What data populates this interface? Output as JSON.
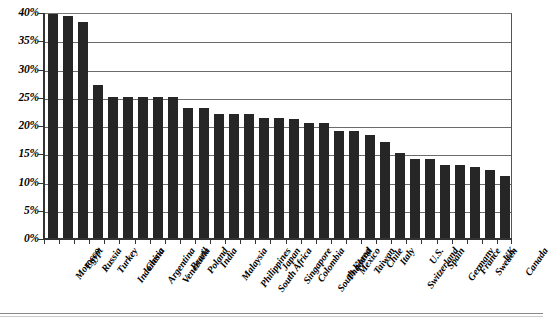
{
  "chart_data": {
    "type": "bar",
    "title": "",
    "xlabel": "",
    "ylabel": "",
    "ylim": [
      0,
      40
    ],
    "ytick_values": [
      0,
      5,
      10,
      15,
      20,
      25,
      30,
      35,
      40
    ],
    "ytick_labels": [
      "0%",
      "5%",
      "10%",
      "15%",
      "20%",
      "25%",
      "30%",
      "35%",
      "40%"
    ],
    "grid": true,
    "legend": "none",
    "bar_color": "#262626",
    "categories": [
      "Morocco",
      "Egypt",
      "Russia",
      "Turkey",
      "Indonesia",
      "China",
      "Argentina",
      "Venezuela",
      "Brazil",
      "Poland",
      "India",
      "Malaysia",
      "Philippines",
      "South Africa",
      "Japan",
      "Singapore",
      "Colombia",
      "South Korea",
      "Thailand",
      "Mexico",
      "Taiwan",
      "Chile",
      "Italy",
      "Switzerland",
      "U.S.",
      "Spain",
      "Germany",
      "France",
      "Sweden",
      "UK",
      "Canada"
    ],
    "values": [
      41,
      39.3,
      38.3,
      27,
      25,
      25,
      25,
      25,
      25,
      23,
      23,
      22,
      22,
      22,
      21.3,
      21.3,
      21,
      20.3,
      20.3,
      19,
      19,
      18.3,
      17,
      15,
      14,
      14,
      13,
      13,
      12.6,
      12,
      11
    ]
  }
}
